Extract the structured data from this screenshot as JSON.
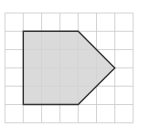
{
  "diagram": {
    "type": "grid-polygon",
    "grid": {
      "columns": 7,
      "rows": 6,
      "origin_x": 5,
      "origin_y": 13,
      "cell": 18.3,
      "line_color": "#c8c8c8"
    },
    "polygon": {
      "vertices_grid": [
        [
          1,
          1
        ],
        [
          4,
          1
        ],
        [
          6,
          3
        ],
        [
          4,
          5
        ],
        [
          1,
          5
        ]
      ],
      "fill": "#d4d4d4",
      "stroke": "#333333"
    }
  }
}
